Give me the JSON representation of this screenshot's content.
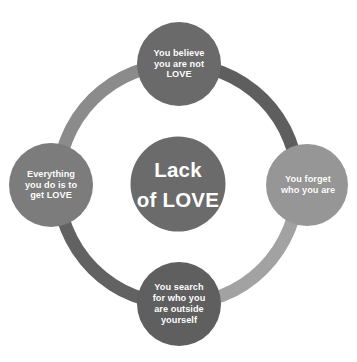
{
  "diagram": {
    "type": "cycle",
    "background_color": "#ffffff",
    "center": {
      "id": "lack-of-love",
      "label": "Lack\nof  LOVE",
      "fill": "#6b6b6b",
      "text_color": "#ffffff"
    },
    "ring": {
      "stroke_width": 13,
      "radius": 120,
      "segments": [
        {
          "id": "arc-top-left",
          "color": "#8b8b8b"
        },
        {
          "id": "arc-top-right",
          "color": "#5e5e5e"
        },
        {
          "id": "arc-bottom-right",
          "color": "#a2a2a2"
        },
        {
          "id": "arc-bottom-left",
          "color": "#626262"
        }
      ]
    },
    "nodes": [
      {
        "id": "node-top",
        "position": "top",
        "label": "You believe\nyou are not\nLOVE",
        "fill": "#6a6a6a",
        "text_color": "#ffffff"
      },
      {
        "id": "node-right",
        "position": "right",
        "label": "You forget\nwho you are",
        "fill": "#969696",
        "text_color": "#ffffff"
      },
      {
        "id": "node-bottom",
        "position": "bottom",
        "label": "You search\nfor who you\nare outside\nyourself",
        "fill": "#5f5f5f",
        "text_color": "#ffffff"
      },
      {
        "id": "node-left",
        "position": "left",
        "label": "Everything\nyou do is to\nget LOVE",
        "fill": "#7c7c7c",
        "text_color": "#ffffff"
      }
    ]
  }
}
